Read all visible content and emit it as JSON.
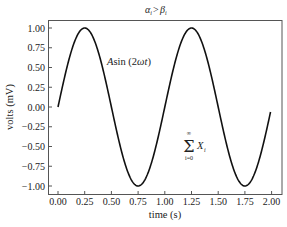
{
  "chart_data": {
    "type": "line",
    "xlabel": "time (s)",
    "ylabel": "volts (mV)",
    "xlim": [
      -0.1,
      2.1
    ],
    "ylim": [
      -1.1,
      1.1
    ],
    "grid": false,
    "legend": null,
    "x_ticks": [
      "0.00",
      "0.25",
      "0.50",
      "0.75",
      "1.00",
      "1.25",
      "1.50",
      "1.75",
      "2.00"
    ],
    "y_ticks": [
      "1.00",
      "0.75",
      "0.50",
      "0.25",
      "0.00",
      "−0.25",
      "−0.50",
      "−0.75",
      "−1.00"
    ],
    "series": [
      {
        "name": "sin(2πt)",
        "color": "#111111",
        "x": [
          0.0,
          0.125,
          0.25,
          0.375,
          0.5,
          0.625,
          0.75,
          0.875,
          1.0,
          1.125,
          1.25,
          1.375,
          1.5,
          1.625,
          1.75,
          1.875,
          1.99
        ],
        "values": [
          0.0,
          0.707,
          1.0,
          0.707,
          0.0,
          -0.707,
          -1.0,
          -0.707,
          0.0,
          0.707,
          1.0,
          0.707,
          0.0,
          -0.707,
          -1.0,
          -0.707,
          -0.063
        ]
      }
    ],
    "annotations": [
      {
        "text": "Asin (2ωt)",
        "x": 0.6,
        "y": 0.6
      },
      {
        "text": "Σ_{i=0}^{∞} X_i",
        "x": 1.2,
        "y": -0.55
      }
    ]
  },
  "labels": {
    "title_alpha": "α",
    "title_gt": " > ",
    "title_beta": "β",
    "title_sub": "i",
    "xlabel": "time (s)",
    "ylabel": "volts (mV)",
    "anno1_A": "A",
    "anno1_rest": "sin (2",
    "anno1_omega": "ωt",
    "anno1_close": ")",
    "anno2_sigma": "Σ",
    "anno2_top": "∞",
    "anno2_bottom": "i=0",
    "anno2_X": "X",
    "anno2_sub": "i"
  },
  "ticks": {
    "x": [
      "0.00",
      "0.25",
      "0.50",
      "0.75",
      "1.00",
      "1.25",
      "1.50",
      "1.75",
      "2.00"
    ],
    "y": [
      "1.00",
      "0.75",
      "0.50",
      "0.25",
      "0.00",
      "−0.25",
      "−0.50",
      "−0.75",
      "−1.00"
    ]
  }
}
